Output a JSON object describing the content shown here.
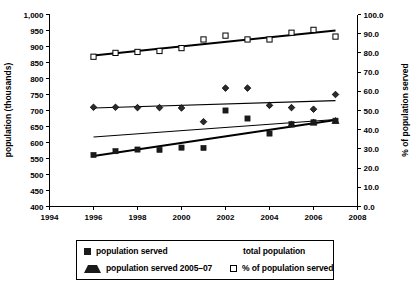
{
  "chart_data": {
    "type": "scatter",
    "title": "",
    "xlabel": "",
    "ylabel": "population (thousands)",
    "y2label": "% of population served",
    "xlim": [
      1994,
      2008
    ],
    "ylim": [
      400,
      1000
    ],
    "y2lim": [
      0.0,
      100.0
    ],
    "grid": false,
    "legend_position": "bottom",
    "x_ticks": [
      "1994",
      "1996",
      "1998",
      "2000",
      "2002",
      "2004",
      "2006",
      "2008"
    ],
    "y_ticks": [
      "400",
      "450",
      "500",
      "550",
      "600",
      "650",
      "700",
      "750",
      "800",
      "850",
      "900",
      "950",
      "1,000"
    ],
    "y2_ticks": [
      "0.0",
      "10.0",
      "20.0",
      "30.0",
      "40.0",
      "50.0",
      "60.0",
      "70.0",
      "80.0",
      "90.0",
      "100.0"
    ],
    "x": [
      1996,
      1997,
      1998,
      1999,
      2000,
      2001,
      2002,
      2003,
      2004,
      2005,
      2006,
      2007
    ],
    "series": [
      {
        "name": "population served",
        "marker": "filled-square",
        "axis": "left",
        "values": [
          561,
          573,
          578,
          577,
          584,
          583,
          700,
          675,
          628,
          657,
          663,
          668
        ]
      },
      {
        "name": "total population",
        "marker": "diamond",
        "axis": "left",
        "values": [
          710,
          710,
          709,
          709,
          708,
          665,
          770,
          770,
          716,
          709,
          704,
          750
        ]
      },
      {
        "name": "population served 2005–07",
        "marker": "filled-triangle",
        "axis": "left",
        "x": [
          2005,
          2006,
          2007
        ],
        "values": [
          657,
          663,
          668
        ]
      },
      {
        "name": "% of population served",
        "marker": "open-square",
        "axis": "right",
        "values": [
          78.0,
          80.0,
          80.5,
          81.0,
          82.5,
          87.0,
          89.0,
          87.0,
          87.0,
          90.5,
          92.0,
          88.5
        ]
      }
    ],
    "trendlines": [
      {
        "name": "% of population served trend",
        "axis": "right",
        "x": [
          1996,
          2007
        ],
        "values": [
          78.6,
          91.7
        ],
        "weight": "thick"
      },
      {
        "name": "total population trend",
        "axis": "left",
        "x": [
          1996,
          2007
        ],
        "values": [
          708,
          731
        ],
        "weight": "thin"
      },
      {
        "name": "population served trend",
        "axis": "left",
        "x": [
          1996,
          2007
        ],
        "values": [
          617,
          672
        ],
        "weight": "thin"
      },
      {
        "name": "population served 2005-07 trend",
        "axis": "left",
        "x": [
          1996,
          2007
        ],
        "values": [
          558,
          670
        ],
        "weight": "thick"
      }
    ]
  },
  "axes": {
    "left_title": "population (thousands)",
    "right_title": "% of population served"
  },
  "legend": {
    "items": [
      {
        "label": "population served",
        "marker": "filled-square"
      },
      {
        "label": "total population",
        "marker": "diamond"
      },
      {
        "label": "population served 2005–07",
        "marker": "filled-triangle"
      },
      {
        "label": "% of population served",
        "marker": "open-square"
      }
    ]
  },
  "colors": {
    "ink": "#000000",
    "marker_fill": "#1a1a1a",
    "background": "#ffffff"
  }
}
